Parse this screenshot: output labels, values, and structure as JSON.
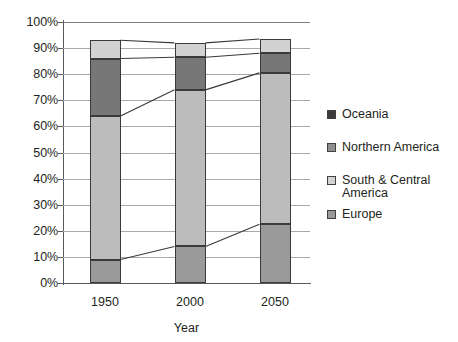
{
  "chart_data": {
    "type": "area",
    "title": "",
    "subtitle": "",
    "xlabel": "Year",
    "ylabel": "",
    "categories": [
      "1950",
      "2000",
      "2050"
    ],
    "x": [
      1950,
      2000,
      2050
    ],
    "ylim": [
      0,
      100
    ],
    "y_tick_labels": [
      "100%",
      "90%",
      "80%",
      "70%",
      "60%",
      "50%",
      "40%",
      "30%",
      "20%",
      "10%",
      "0%"
    ],
    "y_tick_values": [
      100,
      90,
      80,
      70,
      60,
      50,
      40,
      30,
      20,
      10,
      0
    ],
    "grid": true,
    "legend_position": "right",
    "stacked": true,
    "normalized_percent": true,
    "series": [
      {
        "name": "Europe",
        "values": [
          9,
          14,
          22.5
        ],
        "color": "#9a9a9a"
      },
      {
        "name": "South & Central America",
        "values": [
          55,
          60,
          58
        ],
        "color": "#bcbcbc"
      },
      {
        "name": "Northern America",
        "values": [
          22,
          12.5,
          7.5
        ],
        "color": "#777777"
      },
      {
        "name": "Oceania",
        "values": [
          7,
          5.5,
          5.5
        ],
        "color": "#d2d2d2"
      }
    ],
    "cumulative_tops": [
      {
        "name": "Europe",
        "values": [
          9,
          14,
          22.5
        ]
      },
      {
        "name": "South & Central America",
        "values": [
          64,
          74,
          80.5
        ]
      },
      {
        "name": "Northern America",
        "values": [
          86,
          86.5,
          88
        ]
      },
      {
        "name": "Oceania",
        "values": [
          93,
          92,
          93.5
        ]
      }
    ]
  },
  "legend": {
    "items": [
      {
        "label": "Oceania",
        "swatch_color": "#3b3b3b"
      },
      {
        "label": "Northern America",
        "swatch_color": "#8e8e8e"
      },
      {
        "label": "South & Central America",
        "swatch_color": "#d2d2d2"
      },
      {
        "label": "Europe",
        "swatch_color": "#9a9a9a"
      }
    ]
  },
  "axes": {
    "x_title": "Year",
    "x_tick_labels": [
      "1950",
      "2000",
      "2050"
    ],
    "y_tick_labels": [
      "100%",
      "90%",
      "80%",
      "70%",
      "60%",
      "50%",
      "40%",
      "30%",
      "20%",
      "10%",
      "0%"
    ]
  },
  "colors": {
    "oceania": "#d2d2d2",
    "northern_america": "#777777",
    "south_central_america": "#bcbcbc",
    "europe": "#9a9a9a",
    "legend_oceania": "#3b3b3b",
    "legend_northern_america": "#8e8e8e",
    "legend_south_central": "#d2d2d2",
    "legend_europe": "#9a9a9a",
    "gridline": "#a7a9ac",
    "axis": "#58595b",
    "outline": "#3a3a3a",
    "text": "#231f20",
    "background": "#ffffff"
  }
}
